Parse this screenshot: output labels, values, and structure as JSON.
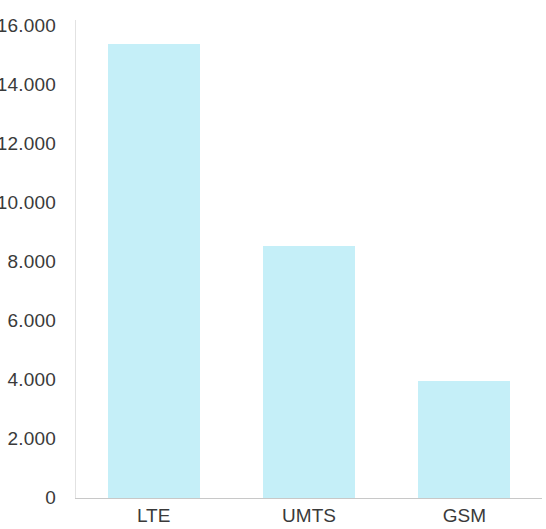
{
  "chart_data": {
    "type": "bar",
    "title": "",
    "subtitle": "",
    "xlabel": "",
    "ylabel": "",
    "categories": [
      "LTE",
      "UMTS",
      "GSM"
    ],
    "values": [
      15400,
      8550,
      3970
    ],
    "series": [
      {
        "name": "",
        "values": [
          15400,
          8550,
          3970
        ]
      }
    ],
    "ylim": [
      0,
      16000
    ],
    "ytick_values": [
      0,
      2000,
      4000,
      6000,
      8000,
      10000,
      12000,
      14000,
      16000
    ],
    "ytick_labels": [
      "0",
      "2.000",
      "4.000",
      "6.000",
      "8.000",
      "10.000",
      "12.000",
      "14.000",
      "16.000"
    ],
    "number_format": "european-dot-thousands",
    "grid": false,
    "legend": false,
    "legend_position": "none",
    "bar_color": "#c5eff8",
    "axis_color": "#c8c8c8",
    "text_color": "#3a3a3a",
    "background_color": "#ffffff"
  },
  "axis": {
    "y_axis_name": "y-axis",
    "x_axis_name": "x-axis"
  }
}
